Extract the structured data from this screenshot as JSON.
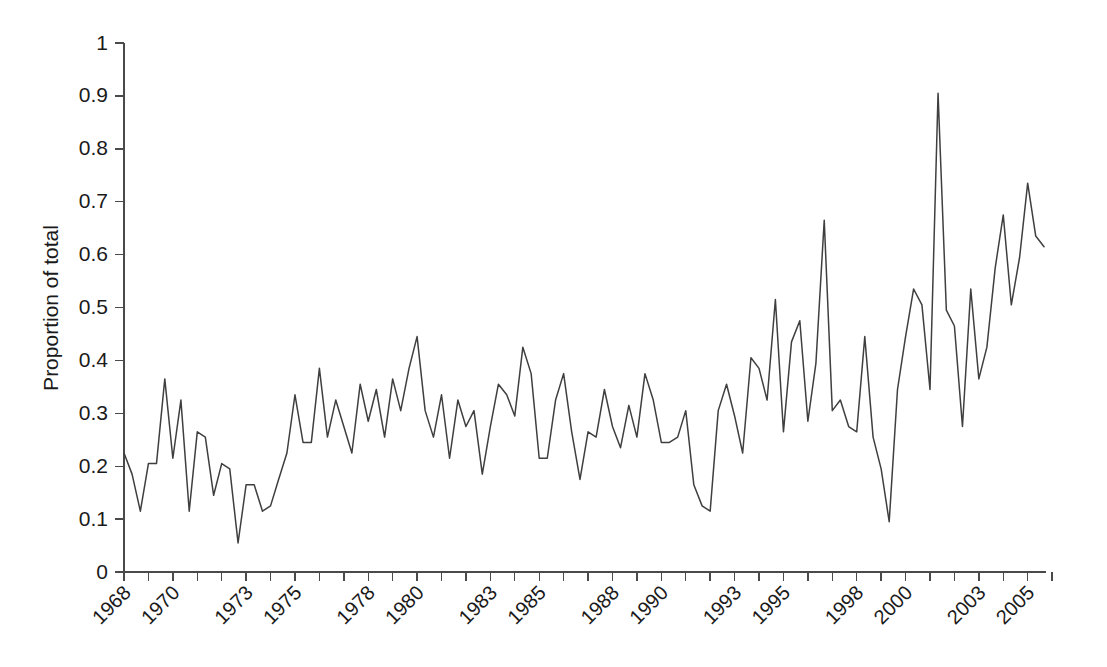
{
  "chart_data": {
    "type": "line",
    "title": "",
    "subtitle": "",
    "xlabel": "",
    "ylabel": "Proportion of total",
    "ylim": [
      0,
      1
    ],
    "xlim": [
      1968,
      2005.75
    ],
    "grid": false,
    "legend": null,
    "y_ticks": [
      "0",
      "0.1",
      "0.2",
      "0.3",
      "0.4",
      "0.5",
      "0.6",
      "0.7",
      "0.8",
      "0.9",
      "1"
    ],
    "y_tick_values": [
      0,
      0.1,
      0.2,
      0.3,
      0.4,
      0.5,
      0.6,
      0.7,
      0.8,
      0.9,
      1
    ],
    "x_tick_labels": [
      "1968",
      "",
      "1970",
      "",
      "",
      "1973",
      "",
      "1975",
      "",
      "",
      "1978",
      "",
      "1980",
      "",
      "",
      "1983",
      "",
      "1985",
      "",
      "",
      "1988",
      "",
      "1990",
      "",
      "",
      "1993",
      "",
      "1995",
      "",
      "",
      "1998",
      "",
      "2000",
      "",
      "",
      "2003",
      "",
      "2005",
      ""
    ],
    "x_tick_values": [
      1968,
      1969,
      1970,
      1971,
      1972,
      1973,
      1974,
      1975,
      1976,
      1977,
      1978,
      1979,
      1980,
      1981,
      1982,
      1983,
      1984,
      1985,
      1986,
      1987,
      1988,
      1989,
      1990,
      1991,
      1992,
      1993,
      1994,
      1995,
      1996,
      1997,
      1998,
      1999,
      2000,
      2001,
      2002,
      2003,
      2004,
      2005,
      2006
    ],
    "series": [
      {
        "name": "Proportion of total",
        "color": "#3f3f3f",
        "x": [
          1968.0,
          1968.33,
          1968.67,
          1969.0,
          1969.33,
          1969.67,
          1970.0,
          1970.33,
          1970.67,
          1971.0,
          1971.33,
          1971.67,
          1972.0,
          1972.33,
          1972.67,
          1973.0,
          1973.33,
          1973.67,
          1974.0,
          1974.33,
          1974.67,
          1975.0,
          1975.33,
          1975.67,
          1976.0,
          1976.33,
          1976.67,
          1977.0,
          1977.33,
          1977.67,
          1978.0,
          1978.33,
          1978.67,
          1979.0,
          1979.33,
          1979.67,
          1980.0,
          1980.33,
          1980.67,
          1981.0,
          1981.33,
          1981.67,
          1982.0,
          1982.33,
          1982.67,
          1983.0,
          1983.33,
          1983.67,
          1984.0,
          1984.33,
          1984.67,
          1985.0,
          1985.33,
          1985.67,
          1986.0,
          1986.33,
          1986.67,
          1987.0,
          1987.33,
          1987.67,
          1988.0,
          1988.33,
          1988.67,
          1989.0,
          1989.33,
          1989.67,
          1990.0,
          1990.33,
          1990.67,
          1991.0,
          1991.33,
          1991.67,
          1992.0,
          1992.33,
          1992.67,
          1993.0,
          1993.33,
          1993.67,
          1994.0,
          1994.33,
          1994.67,
          1995.0,
          1995.33,
          1995.67,
          1996.0,
          1996.33,
          1996.67,
          1997.0,
          1997.33,
          1997.67,
          1998.0,
          1998.33,
          1998.67,
          1999.0,
          1999.33,
          1999.67,
          2000.0,
          2000.33,
          2000.67,
          2001.0,
          2001.33,
          2001.67,
          2002.0,
          2002.33,
          2002.67,
          2003.0,
          2003.33,
          2003.67,
          2004.0,
          2004.33,
          2004.67,
          2005.0,
          2005.33,
          2005.67
        ],
        "y": [
          0.225,
          0.185,
          0.115,
          0.205,
          0.205,
          0.365,
          0.215,
          0.325,
          0.115,
          0.265,
          0.255,
          0.145,
          0.205,
          0.195,
          0.055,
          0.165,
          0.165,
          0.115,
          0.125,
          0.175,
          0.225,
          0.335,
          0.245,
          0.245,
          0.385,
          0.255,
          0.325,
          0.275,
          0.225,
          0.355,
          0.285,
          0.345,
          0.255,
          0.365,
          0.305,
          0.385,
          0.445,
          0.305,
          0.255,
          0.335,
          0.215,
          0.325,
          0.275,
          0.305,
          0.185,
          0.275,
          0.355,
          0.335,
          0.295,
          0.425,
          0.375,
          0.215,
          0.215,
          0.325,
          0.375,
          0.265,
          0.175,
          0.265,
          0.255,
          0.345,
          0.275,
          0.235,
          0.315,
          0.255,
          0.375,
          0.325,
          0.245,
          0.245,
          0.255,
          0.305,
          0.165,
          0.125,
          0.115,
          0.305,
          0.355,
          0.295,
          0.225,
          0.405,
          0.385,
          0.325,
          0.515,
          0.265,
          0.435,
          0.475,
          0.285,
          0.395,
          0.665,
          0.305,
          0.325,
          0.275,
          0.265,
          0.445,
          0.255,
          0.195,
          0.095,
          0.345,
          0.445,
          0.535,
          0.505,
          0.345,
          0.905,
          0.495,
          0.465,
          0.275,
          0.535,
          0.365,
          0.425,
          0.575,
          0.675,
          0.505,
          0.595,
          0.735,
          0.635,
          0.615
        ]
      }
    ]
  },
  "axis": {
    "y_title": "Proportion of total"
  }
}
